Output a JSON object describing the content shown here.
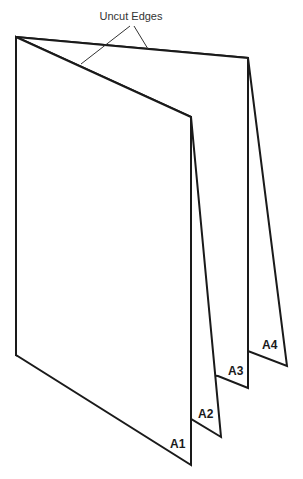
{
  "diagram": {
    "callout": "Uncut Edges",
    "pages": [
      {
        "id": "A1",
        "label": "A1"
      },
      {
        "id": "A2",
        "label": "A2"
      },
      {
        "id": "A3",
        "label": "A3"
      },
      {
        "id": "A4",
        "label": "A4"
      }
    ]
  }
}
